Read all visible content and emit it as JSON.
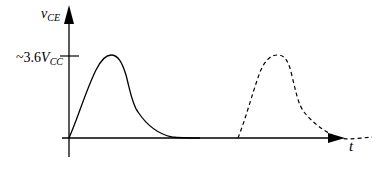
{
  "diagram": {
    "y_axis": {
      "label_main": "v",
      "label_sub": "CE"
    },
    "x_axis": {
      "label": "t"
    },
    "y_tick": {
      "label_prefix": "~3.6",
      "label_main": "V",
      "label_sub": "CC"
    },
    "curves": [
      {
        "name": "pulse-solid",
        "style": "solid",
        "peak_label": "~3.6V_CC"
      },
      {
        "name": "pulse-dashed",
        "style": "dashed",
        "peak_label": "~3.6V_CC"
      }
    ],
    "colors": {
      "stroke": "#000000",
      "background": "#ffffff"
    }
  }
}
